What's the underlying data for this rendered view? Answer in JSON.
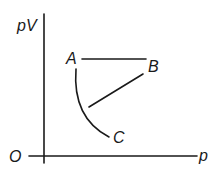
{
  "diagram": {
    "type": "pV-p graph",
    "axes": {
      "y_label": "pV",
      "x_label": "p",
      "origin_label": "O"
    },
    "points": [
      {
        "id": "A",
        "label": "A"
      },
      {
        "id": "B",
        "label": "B"
      },
      {
        "id": "C",
        "label": "C"
      }
    ],
    "segments": [
      {
        "from": "A",
        "to": "B",
        "shape": "horizontal straight line"
      },
      {
        "from": "B",
        "to": "C",
        "shape": "straight line"
      },
      {
        "from": "A",
        "to": "C",
        "shape": "curve"
      }
    ],
    "colors": {
      "ink": "#1a1a1a",
      "background": "#ffffff"
    }
  }
}
